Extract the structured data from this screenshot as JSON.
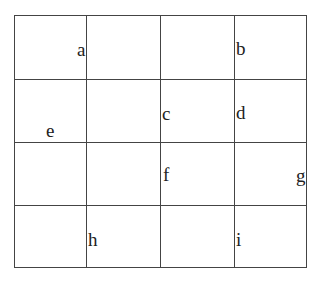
{
  "grid": {
    "rows": 4,
    "cols": 4,
    "labels": {
      "a": "a",
      "b": "b",
      "c": "c",
      "d": "d",
      "e": "e",
      "f": "f",
      "g": "g",
      "h": "h",
      "i": "i"
    },
    "label_positions": [
      {
        "label": "a",
        "row": 0,
        "near": "right edge of column 0"
      },
      {
        "label": "b",
        "row": 0,
        "near": "left edge of column 3"
      },
      {
        "label": "c",
        "row": 1,
        "near": "left edge of column 2"
      },
      {
        "label": "d",
        "row": 1,
        "near": "left edge of column 3"
      },
      {
        "label": "e",
        "row": 1,
        "near": "bottom-left of column 0"
      },
      {
        "label": "f",
        "row": 2,
        "near": "left edge of column 2"
      },
      {
        "label": "g",
        "row": 2,
        "near": "right edge of column 3"
      },
      {
        "label": "h",
        "row": 3,
        "near": "left edge of column 1"
      },
      {
        "label": "i",
        "row": 3,
        "near": "left edge of column 3"
      }
    ]
  }
}
